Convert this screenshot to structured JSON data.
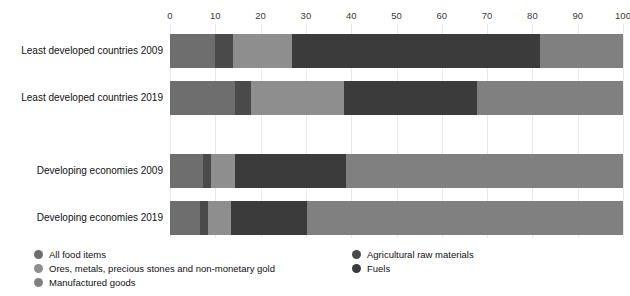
{
  "chart_data": {
    "type": "bar",
    "orientation": "horizontal",
    "stacked": true,
    "normalized": true,
    "title": "",
    "subtitle": "",
    "xlabel": "",
    "ylabel": "",
    "xlim": [
      0,
      100
    ],
    "ylim": null,
    "grid": true,
    "grid_axis": "x",
    "legend_position": "bottom",
    "xticks": [
      0,
      10,
      20,
      30,
      40,
      50,
      60,
      70,
      80,
      90,
      100
    ],
    "xtick_labels": [
      "0",
      "10",
      "20",
      "30",
      "40",
      "50",
      "60",
      "70",
      "80",
      "90",
      "100"
    ],
    "categories": [
      "Least developed countries 2009",
      "Least developed countries 2019",
      "Developing economies 2009",
      "Developing economies 2019"
    ],
    "series": [
      {
        "name": "All food items",
        "color": "#6e6e6e",
        "values": [
          10.0,
          14.3,
          7.2,
          6.7
        ]
      },
      {
        "name": "Agricultural raw materials",
        "color": "#4a4a4a",
        "values": [
          3.8,
          3.5,
          1.8,
          1.6
        ]
      },
      {
        "name": "Ores, metals, precious stones and non-monetary gold",
        "color": "#8e8e8e",
        "values": [
          13.1,
          20.7,
          5.4,
          5.1
        ]
      },
      {
        "name": "Fuels",
        "color": "#3b3b3b",
        "values": [
          54.8,
          29.3,
          24.4,
          16.9
        ]
      },
      {
        "name": "Manufactured goods",
        "color": "#808080",
        "values": [
          18.3,
          32.2,
          61.2,
          69.7
        ]
      }
    ],
    "legend_entries": [
      {
        "label": "All food items",
        "color": "#6e6e6e",
        "column": "left"
      },
      {
        "label": "Ores, metals, precious stones and non-monetary gold",
        "color": "#8e8e8e",
        "column": "left"
      },
      {
        "label": "Manufactured goods",
        "color": "#808080",
        "column": "left"
      },
      {
        "label": "Agricultural raw materials",
        "color": "#4a4a4a",
        "column": "right"
      },
      {
        "label": "Fuels",
        "color": "#3b3b3b",
        "column": "right"
      }
    ]
  },
  "colors": {
    "background": "#ffffff",
    "gridline": "#e9e9e9",
    "tick_text": "#3a3a3a",
    "label_text": "#111111"
  }
}
